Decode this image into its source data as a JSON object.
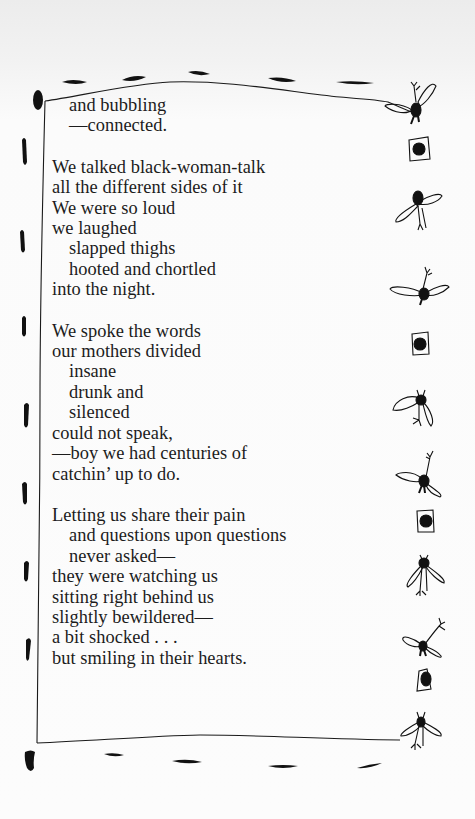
{
  "poem": {
    "stanzas": [
      {
        "lines": [
          {
            "text": "and bubbling",
            "indent": true
          },
          {
            "text": "—connected.",
            "indent": true
          }
        ]
      },
      {
        "lines": [
          {
            "text": "We talked black-woman-talk",
            "indent": false
          },
          {
            "text": "all the different sides of it",
            "indent": false
          },
          {
            "text": "We were so loud",
            "indent": false
          },
          {
            "text": "we laughed",
            "indent": false
          },
          {
            "text": "slapped thighs",
            "indent": true
          },
          {
            "text": "hooted and chortled",
            "indent": true
          },
          {
            "text": "into the night.",
            "indent": false
          }
        ]
      },
      {
        "lines": [
          {
            "text": "We spoke the words",
            "indent": false
          },
          {
            "text": "our mothers divided",
            "indent": false
          },
          {
            "text": "insane",
            "indent": true
          },
          {
            "text": "drunk and",
            "indent": true
          },
          {
            "text": "silenced",
            "indent": true
          },
          {
            "text": "could not speak,",
            "indent": false
          },
          {
            "text": "—boy we had centuries of",
            "indent": false
          },
          {
            "text": "catchin’ up to do.",
            "indent": false
          }
        ]
      },
      {
        "lines": [
          {
            "text": "Letting us share their pain",
            "indent": false
          },
          {
            "text": "and questions upon questions",
            "indent": true
          },
          {
            "text": "never asked—",
            "indent": true
          },
          {
            "text": "they were watching us",
            "indent": false
          },
          {
            "text": "sitting right behind us",
            "indent": false
          },
          {
            "text": "slightly bewildered—",
            "indent": false
          },
          {
            "text": "a bit shocked . . .",
            "indent": false
          },
          {
            "text": "but smiling in their hearts.",
            "indent": false
          }
        ]
      }
    ]
  },
  "decorations": {
    "frame": "hand-drawn-border",
    "left_marks": "ink-dash-marks",
    "top_marks": "ink-dash-marks",
    "bottom_marks": "ink-dash-marks",
    "right_column": [
      "bird",
      "framed-dot",
      "bird",
      "bird",
      "framed-dot",
      "bird",
      "bird",
      "framed-dot",
      "bird",
      "bird",
      "framed-dot",
      "bird"
    ]
  },
  "colors": {
    "ink": "#111111",
    "text": "#1c1c1c",
    "paper": "#fcfcfc"
  }
}
